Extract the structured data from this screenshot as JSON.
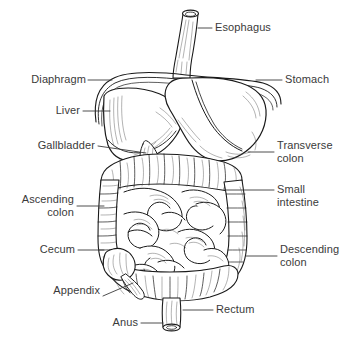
{
  "figure": {
    "background_color": "#ffffff",
    "ink_color": "#1a1a1a",
    "label_color": "#3a3a3a",
    "style": "black ink line drawing"
  },
  "labels": {
    "esophagus": "Esophagus",
    "stomach": "Stomach",
    "diaphragm": "Diaphragm",
    "liver": "Liver",
    "gallbladder": "Gallbladder",
    "transverse_colon": "Transverse\ncolon",
    "small_intestine": "Small\nintestine",
    "ascending_colon": "Ascending\ncolon",
    "descending_colon": "Descending\ncolon",
    "cecum": "Cecum",
    "appendix": "Appendix",
    "rectum": "Rectum",
    "anus": "Anus"
  },
  "organs": [
    {
      "name": "esophagus",
      "side": "top-center"
    },
    {
      "name": "stomach",
      "side": "upper-right"
    },
    {
      "name": "diaphragm",
      "side": "upper-left"
    },
    {
      "name": "liver",
      "side": "upper-left"
    },
    {
      "name": "gallbladder",
      "side": "mid-left"
    },
    {
      "name": "transverse-colon",
      "side": "mid-right"
    },
    {
      "name": "small-intestine",
      "side": "center"
    },
    {
      "name": "ascending-colon",
      "side": "mid-left"
    },
    {
      "name": "descending-colon",
      "side": "lower-right"
    },
    {
      "name": "cecum",
      "side": "lower-left"
    },
    {
      "name": "appendix",
      "side": "lower-left"
    },
    {
      "name": "rectum",
      "side": "bottom-center"
    },
    {
      "name": "anus",
      "side": "bottom-center"
    }
  ]
}
